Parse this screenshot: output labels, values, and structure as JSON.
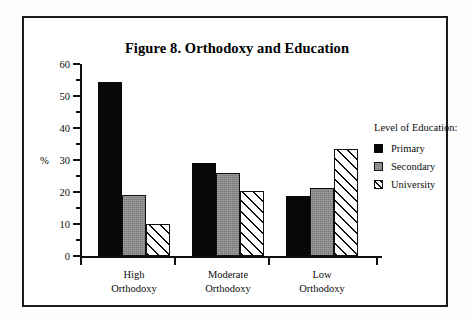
{
  "figure": {
    "title": "Figure 8. Orthodoxy and Education",
    "frame_color": "#1b1b1b",
    "background": "#ffffff"
  },
  "axis": {
    "y_title": "%",
    "y_ticks": [
      "0",
      "10",
      "20",
      "30",
      "40",
      "50",
      "60"
    ],
    "y_min": 0,
    "y_max": 60
  },
  "legend": {
    "title": "Level of Education:",
    "items": [
      {
        "label": "Primary",
        "swatch": "solid-black-swatch",
        "color": "#080808"
      },
      {
        "label": "Secondary",
        "swatch": "solid-gray-swatch",
        "color": "#8b8b8b"
      },
      {
        "label": "University",
        "swatch": "diagonal-hatch-swatch",
        "color": "#ffffff"
      }
    ]
  },
  "groups": [
    {
      "line1": "High",
      "line2": "Orthodoxy"
    },
    {
      "line1": "Moderate",
      "line2": "Orthodoxy"
    },
    {
      "line1": "Low",
      "line2": "Orthodoxy"
    }
  ],
  "chart_data": {
    "type": "bar",
    "title": "Figure 8. Orthodoxy and Education",
    "xlabel": "",
    "ylabel": "%",
    "ylim": [
      0,
      60
    ],
    "yticks": [
      0,
      10,
      20,
      30,
      40,
      50,
      60
    ],
    "grid": false,
    "legend_title": "Level of Education:",
    "legend_position": "right",
    "categories": [
      "High Orthodoxy",
      "Moderate Orthodoxy",
      "Low Orthodoxy"
    ],
    "series": [
      {
        "name": "Primary",
        "values": [
          54.3,
          29.1,
          18.6
        ],
        "fill": "solid-black"
      },
      {
        "name": "Secondary",
        "values": [
          19.0,
          25.9,
          21.4
        ],
        "fill": "solid-gray"
      },
      {
        "name": "University",
        "values": [
          10.0,
          20.4,
          33.4
        ],
        "fill": "diagonal-hatch"
      }
    ]
  }
}
